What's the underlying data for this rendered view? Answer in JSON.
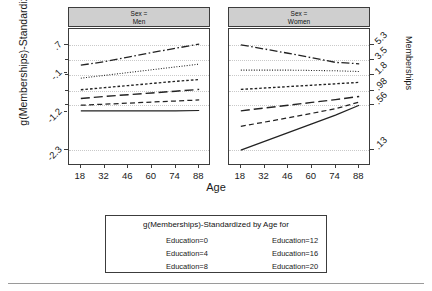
{
  "chart_data": {
    "type": "line",
    "title": "",
    "xlabel": "Age",
    "ylabel": "g(Memberships)-Standardized",
    "y2label": "Memberships",
    "grid": true,
    "legend_position": "bottom",
    "legend_title": "g(Memberships)-Standardized by Age for",
    "x": [
      18,
      32,
      46,
      60,
      74,
      88
    ],
    "xtick_labels": [
      "18",
      "32",
      "46",
      "60",
      "74",
      "88"
    ],
    "xlim": [
      11,
      95
    ],
    "ylim": [
      -2.75,
      1.15
    ],
    "ytick_values": [
      0.7,
      -0.1,
      -1.2,
      -2.3
    ],
    "ytick_labels": [
      ".7",
      "-.1",
      "-1.2",
      "-2.3"
    ],
    "y2tick_values": [
      0.7,
      0.28,
      -0.16,
      -0.62,
      -1.0,
      -2.3
    ],
    "y2tick_labels": [
      "5.3",
      "3.5",
      "1.8",
      ".98",
      ".56",
      ".13"
    ],
    "panels": [
      {
        "name": "men",
        "strip_line1": "Sex =",
        "strip_line2": "Men",
        "series": [
          {
            "name": "Education=0",
            "dash": "solid",
            "values": [
              -1.18,
              -1.18,
              -1.18,
              -1.18,
              -1.18,
              -1.17
            ]
          },
          {
            "name": "Education=4",
            "dash": "dashed",
            "values": [
              -1.02,
              -0.99,
              -0.96,
              -0.93,
              -0.9,
              -0.87
            ]
          },
          {
            "name": "Education=8",
            "dash": "longdash",
            "values": [
              -0.83,
              -0.77,
              -0.72,
              -0.67,
              -0.62,
              -0.57
            ]
          },
          {
            "name": "Education=12",
            "dash": "dotted",
            "values": [
              -0.58,
              -0.52,
              -0.46,
              -0.4,
              -0.34,
              -0.29
            ]
          },
          {
            "name": "Education=16",
            "dash": "finedot",
            "values": [
              -0.25,
              -0.17,
              -0.09,
              -0.01,
              0.07,
              0.15
            ]
          },
          {
            "name": "Education=20",
            "dash": "dashdot",
            "values": [
              0.12,
              0.22,
              0.35,
              0.48,
              0.6,
              0.72
            ]
          }
        ]
      },
      {
        "name": "women",
        "strip_line1": "Sex =",
        "strip_line2": "Women",
        "series": [
          {
            "name": "Education=0",
            "dash": "solid",
            "values": [
              -2.3,
              -2.05,
              -1.8,
              -1.55,
              -1.3,
              -1.02
            ]
          },
          {
            "name": "Education=4",
            "dash": "dashed",
            "values": [
              -1.62,
              -1.5,
              -1.38,
              -1.25,
              -1.12,
              -0.93
            ]
          },
          {
            "name": "Education=8",
            "dash": "longdash",
            "values": [
              -1.18,
              -1.1,
              -1.02,
              -0.94,
              -0.86,
              -0.77
            ]
          },
          {
            "name": "Education=12",
            "dash": "dotted",
            "values": [
              -0.57,
              -0.53,
              -0.49,
              -0.45,
              -0.41,
              -0.37
            ]
          },
          {
            "name": "Education=16",
            "dash": "finedot",
            "values": [
              -0.02,
              -0.02,
              -0.02,
              -0.03,
              -0.04,
              -0.06
            ]
          },
          {
            "name": "Education=20",
            "dash": "dashdot",
            "values": [
              0.7,
              0.58,
              0.46,
              0.33,
              0.2,
              0.16
            ]
          }
        ]
      }
    ]
  },
  "legend": {
    "title": "g(Memberships)-Standardized by Age for",
    "entries": [
      {
        "label": "Education=0",
        "dash": "solid"
      },
      {
        "label": "Education=4",
        "dash": "dashed"
      },
      {
        "label": "Education=8",
        "dash": "longdash"
      },
      {
        "label": "Education=12",
        "dash": "dotted"
      },
      {
        "label": "Education=16",
        "dash": "finedot"
      },
      {
        "label": "Education=20",
        "dash": "dashdot"
      }
    ]
  }
}
